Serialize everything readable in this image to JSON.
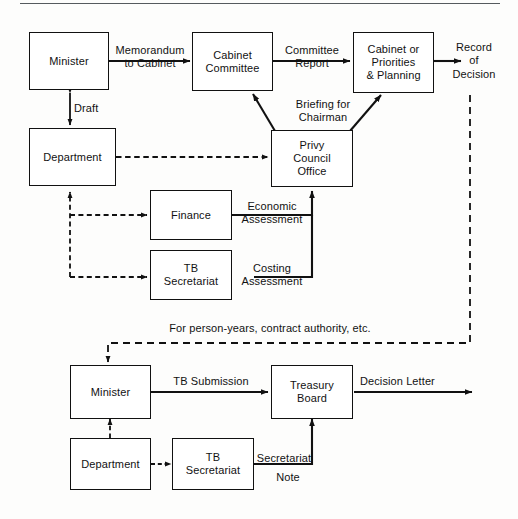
{
  "figure": {
    "top_rule": "horizontal-rule",
    "line_color": "#111111",
    "box_fill": "#ffffff",
    "background": "#fdfdfc"
  },
  "upper_process": {
    "nodes": [
      {
        "id": "minister-top",
        "label": "Minister"
      },
      {
        "id": "department-top",
        "label": "Department"
      },
      {
        "id": "cabinet-committee",
        "label": "Cabinet\nCommittee"
      },
      {
        "id": "cabinet-or-priorities",
        "label": "Cabinet or\nPriorities\n& Planning"
      },
      {
        "id": "privy-council-office",
        "label": "Privy\nCouncil\nOffice"
      },
      {
        "id": "finance",
        "label": "Finance"
      },
      {
        "id": "tb-secretariat-top",
        "label": "TB\nSecretariat"
      }
    ],
    "edge_labels": [
      {
        "id": "memorandum-to-cabinet",
        "text": "Memorandum\nto Cabinet"
      },
      {
        "id": "draft",
        "text": "Draft"
      },
      {
        "id": "committee-report",
        "text": "Committee\nReport"
      },
      {
        "id": "briefing-for-chairman",
        "text": "Briefing for\nChairman"
      },
      {
        "id": "economic-assessment",
        "text": "Economic\nAssessment"
      },
      {
        "id": "costing-assessment",
        "text": "Costing\nAssessment"
      }
    ],
    "terminal": {
      "id": "record-of-decision",
      "text": "Record\nof\nDecision"
    }
  },
  "link_note": {
    "id": "person-years-note",
    "text": "For person-years, contract authority, etc."
  },
  "lower_process": {
    "nodes": [
      {
        "id": "minister-bottom",
        "label": "Minister"
      },
      {
        "id": "department-bottom",
        "label": "Department"
      },
      {
        "id": "tb-secretariat-bottom",
        "label": "TB\nSecretariat"
      },
      {
        "id": "treasury-board",
        "label": "Treasury\nBoard"
      }
    ],
    "edge_labels": [
      {
        "id": "tb-submission",
        "text": "TB Submission"
      },
      {
        "id": "secretariat-note",
        "text": "Secretariat"
      },
      {
        "id": "secretariat-note-second",
        "text": "Note"
      }
    ],
    "terminal": {
      "id": "decision-letter",
      "text": "Decision Letter"
    }
  }
}
